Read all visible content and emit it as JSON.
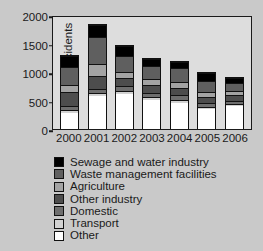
{
  "chart_data": {
    "type": "bar",
    "stacked": true,
    "title": "",
    "xlabel": "",
    "ylabel": "Number of incidents",
    "ylim": [
      0,
      2000
    ],
    "yticks": [
      0,
      500,
      1000,
      1500,
      2000
    ],
    "grid": false,
    "legend_position": "below",
    "categories": [
      "2000",
      "2001",
      "2002",
      "2003",
      "2004",
      "2005",
      "2006"
    ],
    "series": [
      {
        "name": "Other",
        "color": "#ffffff",
        "values": [
          280,
          590,
          630,
          520,
          470,
          355,
          405
        ]
      },
      {
        "name": "Transport",
        "color": "#d2d2d2",
        "values": [
          65,
          55,
          50,
          45,
          55,
          45,
          40
        ]
      },
      {
        "name": "Domestic",
        "color": "#6e6e6e",
        "values": [
          60,
          60,
          75,
          80,
          75,
          60,
          55
        ]
      },
      {
        "name": "Other industry",
        "color": "#4d4d4d",
        "values": [
          255,
          230,
          145,
          130,
          130,
          115,
          105
        ]
      },
      {
        "name": "Agriculture",
        "color": "#a3a3a3",
        "values": [
          130,
          215,
          105,
          110,
          110,
          85,
          70
        ]
      },
      {
        "name": "Waste management facilities",
        "color": "#5f5f5f",
        "values": [
          320,
          480,
          290,
          235,
          245,
          190,
          150
        ]
      },
      {
        "name": "Sewage and water industry",
        "color": "#000000",
        "values": [
          190,
          210,
          175,
          130,
          110,
          145,
          90
        ]
      }
    ],
    "totals": [
      1300,
      1840,
      1470,
      1250,
      1195,
      995,
      915
    ]
  },
  "axis": {
    "ylabel": "Number of incidents",
    "yticks": [
      "2000",
      "1500",
      "1000",
      "500",
      "0"
    ],
    "xticks": [
      "2000",
      "2001",
      "2002",
      "2003",
      "2004",
      "2005",
      "2006"
    ]
  },
  "legend": {
    "items": [
      {
        "label": "Sewage and water industry",
        "color": "#000000"
      },
      {
        "label": "Waste management facilities",
        "color": "#5f5f5f"
      },
      {
        "label": "Agriculture",
        "color": "#a3a3a3"
      },
      {
        "label": "Other industry",
        "color": "#4d4d4d"
      },
      {
        "label": "Domestic",
        "color": "#6e6e6e"
      },
      {
        "label": "Transport",
        "color": "#d2d2d2"
      },
      {
        "label": "Other",
        "color": "#ffffff"
      }
    ]
  }
}
